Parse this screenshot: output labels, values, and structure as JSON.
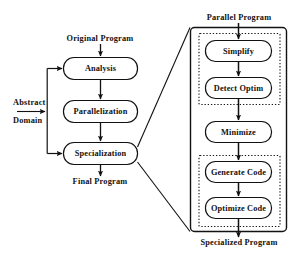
{
  "diagram": {
    "title_labels": {
      "original_program": "Original Program",
      "final_program": "Final Program",
      "abstract": "Abstract",
      "domain": "Domain",
      "parallel_program": "Parallel  Program",
      "specialized_program": "Specialized Program"
    },
    "left_pipeline": {
      "nodes": [
        {
          "id": "analysis",
          "label": "Analysis"
        },
        {
          "id": "parallelization",
          "label": "Parallelization"
        },
        {
          "id": "specialization",
          "label": "Specialization"
        }
      ]
    },
    "right_panel": {
      "header_label": "Parallel  Program",
      "footer_label": "Specialized Program",
      "group_one": {
        "nodes": [
          {
            "id": "simplify",
            "label": "Simplify"
          },
          {
            "id": "detect-optim",
            "label": "Detect  Optim"
          }
        ]
      },
      "middle": {
        "nodes": [
          {
            "id": "minimize",
            "label": "Minimize"
          }
        ]
      },
      "group_two": {
        "nodes": [
          {
            "id": "generate-code",
            "label": "Generate Code"
          },
          {
            "id": "optimize-code",
            "label": "Optimize Code"
          }
        ]
      }
    },
    "colors": {
      "stroke": "#111111",
      "background": "#ffffff",
      "text": "#111111"
    }
  }
}
